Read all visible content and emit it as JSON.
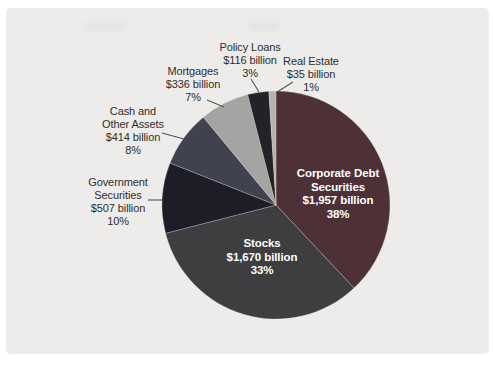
{
  "page": {
    "background_color": "#ffffff",
    "panel_background_color": "#edecea"
  },
  "chart_data": {
    "type": "pie",
    "title": "",
    "legend": "none",
    "start_angle_deg_from_north": 0,
    "direction": "clockwise",
    "inside_label_text_color": "#ffffff",
    "outside_label_text_color": "#2f2e2c",
    "leader_line_color": "#55534f",
    "slices": [
      {
        "label": "Corporate Debt Securities",
        "value": 1957,
        "value_text": "$1,957 billion",
        "percent": 38,
        "percent_text": "38%",
        "color": "#4d3137",
        "label_position": "inside",
        "label_lines": [
          "Corporate Debt",
          "Securities",
          "$1,957 billion",
          "38%"
        ]
      },
      {
        "label": "Stocks",
        "value": 1670,
        "value_text": "$1,670 billion",
        "percent": 33,
        "percent_text": "33%",
        "color": "#3e3d3f",
        "label_position": "inside",
        "label_lines": [
          "Stocks",
          "$1,670 billion",
          "33%"
        ]
      },
      {
        "label": "Government Securities",
        "value": 507,
        "value_text": "$507 billion",
        "percent": 10,
        "percent_text": "10%",
        "color": "#1e1d27",
        "label_position": "outside",
        "label_lines": [
          "Government",
          "Securities",
          "$507 billion",
          "10%"
        ]
      },
      {
        "label": "Cash and Other Assets",
        "value": 414,
        "value_text": "$414 billion",
        "percent": 8,
        "percent_text": "8%",
        "color": "#414250",
        "label_position": "outside",
        "label_lines": [
          "Cash and",
          "Other Assets",
          "$414 billion",
          "8%"
        ]
      },
      {
        "label": "Mortgages",
        "value": 336,
        "value_text": "$336 billion",
        "percent": 7,
        "percent_text": "7%",
        "color": "#a6a4a2",
        "label_position": "outside",
        "label_lines": [
          "Mortgages",
          "$336 billion",
          "7%"
        ]
      },
      {
        "label": "Policy Loans",
        "value": 116,
        "value_text": "$116 billion",
        "percent": 3,
        "percent_text": "3%",
        "color": "#232226",
        "label_position": "outside",
        "label_lines": [
          "Policy Loans",
          "$116 billion",
          "3%"
        ]
      },
      {
        "label": "Real Estate",
        "value": 35,
        "value_text": "$35 billion",
        "percent": 1,
        "percent_text": "1%",
        "color": "#b6b4b2",
        "label_position": "outside",
        "label_lines": [
          "Real Estate",
          "$35 billion",
          "1%"
        ]
      }
    ]
  }
}
